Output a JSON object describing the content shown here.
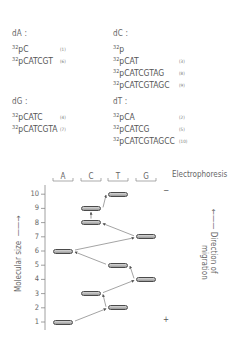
{
  "groups": [
    {
      "title": "dA :",
      "x": 12,
      "y": 29,
      "items": [
        {
          "sup": "32",
          "seq": "pC",
          "num": "(1)"
        },
        {
          "sup": "32",
          "seq": "pCATCGT",
          "num": "(6)"
        }
      ]
    },
    {
      "title": "dC :",
      "x": 113,
      "y": 29,
      "items": [
        {
          "sup": "32",
          "seq": "p",
          "num": ""
        },
        {
          "sup": "32",
          "seq": "pCAT",
          "num": "(3)"
        },
        {
          "sup": "32",
          "seq": "pCATCGTAG",
          "num": "(8)"
        },
        {
          "sup": "32",
          "seq": "pCATCGTAGC",
          "num": "(9)"
        }
      ]
    },
    {
      "title": "dG :",
      "x": 12,
      "y": 97,
      "items": [
        {
          "sup": "32",
          "seq": "pCATC",
          "num": "(4)"
        },
        {
          "sup": "32",
          "seq": "pCATCGTA",
          "num": "(7)"
        }
      ]
    },
    {
      "title": "dT :",
      "x": 113,
      "y": 97,
      "items": [
        {
          "sup": "32",
          "seq": "pCA",
          "num": "(2)"
        },
        {
          "sup": "32",
          "seq": "pCATCG",
          "num": "(5)"
        },
        {
          "sup": "32",
          "seq": "pCATCGTAGCC",
          "num": "(10)"
        }
      ]
    }
  ],
  "gel": {
    "title": "Electrophoresis",
    "y_axis_label": "Molecular size",
    "direction_label_line1": "Direction of",
    "direction_label_line2": "migration",
    "negative_electrode": "−",
    "positive_electrode": "+",
    "lanes": [
      "A",
      "C",
      "T",
      "G"
    ],
    "ticks": [
      "1",
      "2",
      "3",
      "4",
      "5",
      "6",
      "7",
      "8",
      "9",
      "10"
    ]
  },
  "chart_data": {
    "type": "diagram",
    "title": "Electrophoresis",
    "ylabel": "Molecular size",
    "lanes": [
      "A",
      "C",
      "T",
      "G"
    ],
    "ylim": [
      1,
      10
    ],
    "bands": [
      {
        "size": 1,
        "lane": "A",
        "sequence": "pC"
      },
      {
        "size": 2,
        "lane": "T",
        "sequence": "pCA"
      },
      {
        "size": 3,
        "lane": "C",
        "sequence": "pCAT"
      },
      {
        "size": 4,
        "lane": "G",
        "sequence": "pCATC"
      },
      {
        "size": 5,
        "lane": "T",
        "sequence": "pCATCG"
      },
      {
        "size": 6,
        "lane": "A",
        "sequence": "pCATCGT"
      },
      {
        "size": 7,
        "lane": "G",
        "sequence": "pCATCGTA"
      },
      {
        "size": 8,
        "lane": "C",
        "sequence": "pCATCGTAG"
      },
      {
        "size": 9,
        "lane": "C",
        "sequence": "pCATCGTAGC"
      },
      {
        "size": 10,
        "lane": "T",
        "sequence": "pCATCGTAGCC"
      }
    ],
    "read_sequence": "CATCGTAGCC"
  }
}
